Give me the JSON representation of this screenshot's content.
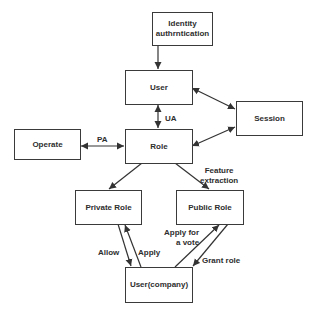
{
  "nodes": {
    "identity": "Identity authrntication",
    "user": "User",
    "session": "Session",
    "operate": "Operate",
    "role": "Role",
    "private_role": "Private Role",
    "public_role": "Public Role",
    "user_company": "User(company)"
  },
  "edges": {
    "ua": "UA",
    "pa": "PA",
    "feature_line1": "Feature",
    "feature_line2": "extraction",
    "allow": "Allow",
    "apply": "Apply",
    "vote_line1": "Apply for",
    "vote_line2": "a vote",
    "grant": "Grant  role"
  }
}
